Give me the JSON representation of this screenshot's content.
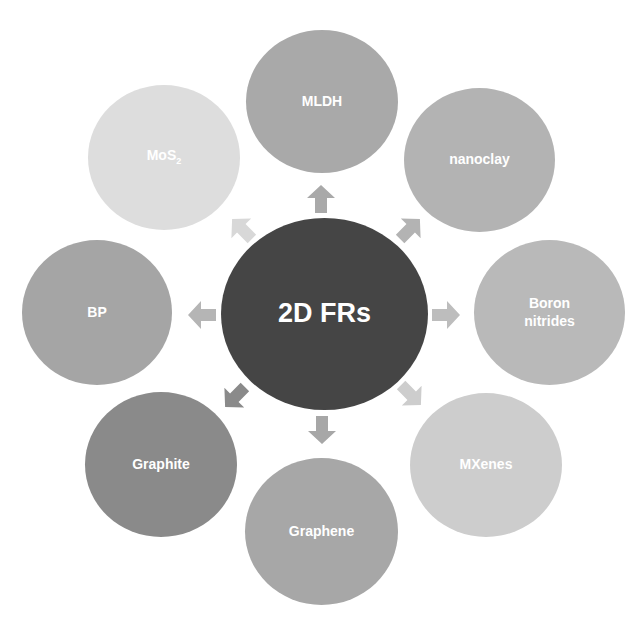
{
  "diagram": {
    "type": "radial-hub",
    "center": {
      "label": "2D FRs",
      "color": "#454545"
    },
    "satellites": [
      {
        "id": "mldh",
        "label": "MLDH",
        "color": "#a9a9a9"
      },
      {
        "id": "nanoclay",
        "label": "nanoclay",
        "color": "#b3b3b3"
      },
      {
        "id": "boron-nitrides",
        "label": "Boron\nnitrides",
        "color": "#b9b9b9"
      },
      {
        "id": "mxenes",
        "label": "MXenes",
        "color": "#cdcdcd"
      },
      {
        "id": "graphene",
        "label": "Graphene",
        "color": "#a7a7a7"
      },
      {
        "id": "graphite",
        "label": "Graphite",
        "color": "#8a8a8a"
      },
      {
        "id": "bp",
        "label": "BP",
        "color": "#a5a5a5"
      },
      {
        "id": "mos2",
        "label": "MoS",
        "label_sub": "2",
        "color": "#dddddd"
      }
    ],
    "arrows": [
      {
        "to": "mldh",
        "direction": "up",
        "color": "#a9a9a9"
      },
      {
        "to": "nanoclay",
        "direction": "up-right",
        "color": "#b3b3b3"
      },
      {
        "to": "boron-nitrides",
        "direction": "right",
        "color": "#bdbdbd"
      },
      {
        "to": "mxenes",
        "direction": "down-right",
        "color": "#cdcdcd"
      },
      {
        "to": "graphene",
        "direction": "down",
        "color": "#a7a7a7"
      },
      {
        "to": "graphite",
        "direction": "down-left",
        "color": "#8a8a8a"
      },
      {
        "to": "bp",
        "direction": "left",
        "color": "#b5b5b5"
      },
      {
        "to": "mos2",
        "direction": "up-left",
        "color": "#d8d8d8"
      }
    ]
  }
}
